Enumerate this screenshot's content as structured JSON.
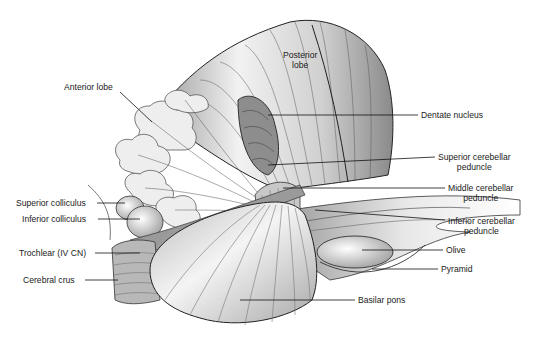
{
  "figure": {
    "labels": {
      "posterior_lobe": "Posterior\nlobe",
      "anterior_lobe": "Anterior lobe",
      "dentate_nucleus": "Dentate nucleus",
      "superior_cerebellar_peduncle": "Superior cerebellar\npeduncle",
      "middle_cerebellar_peduncle": "Middle cerebellar\npeduncle",
      "inferior_cerebellar_peduncle": "Inferior cerebellar\npeduncle",
      "superior_colliculus": "Superior colliculus",
      "inferior_colliculus": "Inferior colliculus",
      "trochlear": "Trochlear (IV CN)",
      "cerebral_crus": "Cerebral crus",
      "olive": "Olive",
      "pyramid": "Pyramid",
      "basilar_pons": "Basilar pons"
    }
  }
}
